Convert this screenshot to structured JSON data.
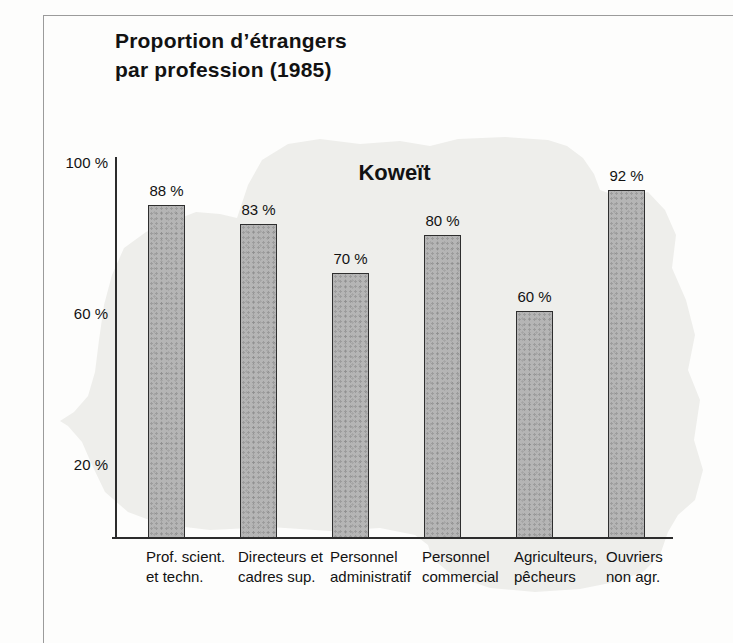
{
  "figure": {
    "title_line1": "Proportion d’étrangers",
    "title_line2": "par profession (1985)"
  },
  "chart_data": {
    "type": "bar",
    "title": "Koweït",
    "categories": [
      "Prof. scient. et techn.",
      "Directeurs et cadres sup.",
      "Personnel administratif",
      "Personnel commercial",
      "Agriculteurs, pêcheurs",
      "Ouvriers non agr."
    ],
    "category_label_lines": [
      [
        "Prof. scient.",
        "et techn."
      ],
      [
        "Directeurs et",
        "cadres sup."
      ],
      [
        "Personnel",
        "administratif"
      ],
      [
        "Personnel",
        "commercial"
      ],
      [
        "Agriculteurs,",
        "pêcheurs"
      ],
      [
        "Ouvriers",
        "non agr."
      ]
    ],
    "values": [
      88,
      83,
      70,
      80,
      60,
      92
    ],
    "value_label_suffix": " %",
    "value_labels": [
      "88 %",
      "83 %",
      "70 %",
      "80 %",
      "60 %",
      "92 %"
    ],
    "yticks": [
      {
        "value": 100,
        "label": "100 %"
      },
      {
        "value": 60,
        "label": "60 %"
      },
      {
        "value": 20,
        "label": "20 %"
      }
    ],
    "ylim": [
      0,
      100
    ],
    "xlabel": "",
    "ylabel": "",
    "grid": false,
    "legend": false,
    "bar_color": "#b5b5b5",
    "bar_border_color": "#2e2e2e",
    "axis_color": "#2c2c2c",
    "background_silhouette_color": "#eeeeeb"
  }
}
